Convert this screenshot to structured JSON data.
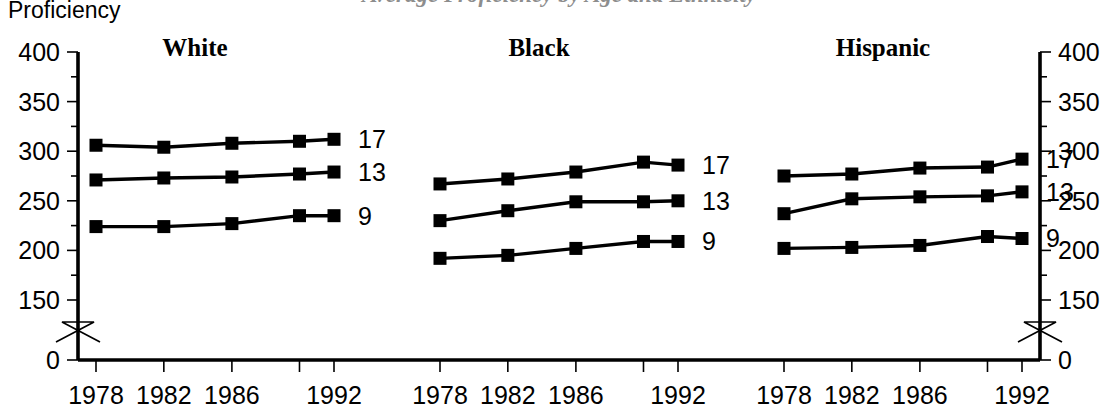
{
  "page": {
    "background_color": "#ffffff",
    "ink_color": "#000000",
    "width": 1118,
    "height": 418
  },
  "top_title_partial": "Average Proficiency by Age and Ethnicity",
  "y_axis_title": "Proficiency",
  "chart_data": {
    "type": "line",
    "title": "Average Proficiency by Age and Ethnicity",
    "xlabel": "",
    "ylabel": "Proficiency",
    "ylim": [
      0,
      400
    ],
    "y_ticks_major": [
      0,
      150,
      200,
      250,
      300,
      350,
      400
    ],
    "y_tick_labels": [
      "0",
      "150",
      "200",
      "250",
      "300",
      "350",
      "400"
    ],
    "y_ticks_minor": [
      175,
      225,
      275,
      325,
      375
    ],
    "y_axis_break_between": [
      0,
      150
    ],
    "grid": false,
    "legend_position": "right-of-each-panel",
    "x": [
      1978,
      1982,
      1986,
      1990,
      1992
    ],
    "x_tick_labels": [
      "1978",
      "1982",
      "1986",
      "",
      "1992"
    ],
    "dual_y_axis": true,
    "panels": [
      {
        "name": "White",
        "series": [
          {
            "name": "17",
            "label": "17",
            "values": [
              306,
              304,
              308,
              310,
              312
            ]
          },
          {
            "name": "13",
            "label": "13",
            "values": [
              271,
              273,
              274,
              277,
              279
            ]
          },
          {
            "name": "9",
            "label": "9",
            "values": [
              224,
              224,
              227,
              235,
              235
            ]
          }
        ]
      },
      {
        "name": "Black",
        "series": [
          {
            "name": "17",
            "label": "17",
            "values": [
              267,
              272,
              279,
              289,
              286
            ]
          },
          {
            "name": "13",
            "label": "13",
            "values": [
              230,
              240,
              249,
              249,
              250
            ]
          },
          {
            "name": "9",
            "label": "9",
            "values": [
              192,
              195,
              202,
              209,
              209
            ]
          }
        ]
      },
      {
        "name": "Hispanic",
        "series": [
          {
            "name": "17",
            "label": "17",
            "values": [
              275,
              277,
              283,
              284,
              292
            ]
          },
          {
            "name": "13",
            "label": "13",
            "values": [
              237,
              252,
              254,
              255,
              259
            ]
          },
          {
            "name": "9",
            "label": "9",
            "values": [
              202,
              203,
              205,
              214,
              212
            ]
          }
        ]
      }
    ]
  },
  "axes": {
    "left": {
      "name": "left-y-axis",
      "tick_labels": [
        "400",
        "350",
        "300",
        "250",
        "200",
        "150",
        "0"
      ],
      "break_symbol": "zigzag"
    },
    "right": {
      "name": "right-y-axis",
      "tick_labels": [
        "400",
        "350",
        "300",
        "250",
        "200",
        "150",
        "0"
      ],
      "break_symbol": "zigzag"
    }
  }
}
